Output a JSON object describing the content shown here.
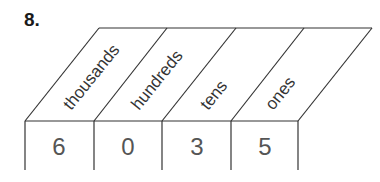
{
  "question_number": "8.",
  "place_value_chart": {
    "columns": [
      {
        "label": "thousands",
        "digit": "6"
      },
      {
        "label": "hundreds",
        "digit": "0"
      },
      {
        "label": "tens",
        "digit": "3"
      },
      {
        "label": "ones",
        "digit": "5"
      }
    ]
  }
}
